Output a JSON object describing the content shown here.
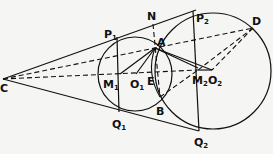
{
  "diagram": {
    "type": "geometry",
    "points": {
      "C": {
        "label": "C",
        "x": 3,
        "y": 79
      },
      "P1": {
        "label": "P",
        "sub": "1",
        "x": 117,
        "y": 37
      },
      "Q1": {
        "label": "Q",
        "sub": "1",
        "x": 119,
        "y": 112
      },
      "M1": {
        "label": "M",
        "sub": "1",
        "x": 119,
        "y": 74
      },
      "O1": {
        "label": "O",
        "sub": "1",
        "x": 135,
        "y": 74
      },
      "N": {
        "label": "N",
        "x": 153,
        "y": 22
      },
      "A": {
        "label": "A",
        "x": 155,
        "y": 48
      },
      "E": {
        "label": "E",
        "x": 157,
        "y": 74
      },
      "B": {
        "label": "B",
        "x": 160,
        "y": 97
      },
      "P2": {
        "label": "P",
        "sub": "2",
        "x": 193,
        "y": 11
      },
      "Q2": {
        "label": "Q",
        "sub": "2",
        "x": 199,
        "y": 131
      },
      "M2": {
        "label": "M",
        "sub": "2",
        "x": 198,
        "y": 70
      },
      "O2": {
        "label": "O",
        "sub": "2",
        "x": 212,
        "y": 70
      },
      "D": {
        "label": "D",
        "x": 253,
        "y": 28
      }
    },
    "circles": [
      {
        "name": "small-circle",
        "cx": 135,
        "cy": 74,
        "r": 37
      },
      {
        "name": "large-circle",
        "cx": 213,
        "cy": 71,
        "r": 58
      }
    ]
  }
}
